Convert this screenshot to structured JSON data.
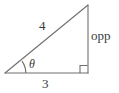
{
  "figure": {
    "type": "right-triangle-diagram",
    "stroke_color": "#6e6e6e",
    "text_color": "#3a3a3a",
    "background_color": "#ffffff",
    "geometry": {
      "vertex_left": [
        5,
        73
      ],
      "vertex_bottom_right": [
        88,
        73
      ],
      "vertex_top_right": [
        88,
        5
      ],
      "right_angle_marker": {
        "at_vertex": "bottom-right",
        "size": 8
      },
      "angle_arc": {
        "at_vertex": "left",
        "radius": 20,
        "label": "theta"
      }
    },
    "labels": {
      "hypotenuse": "4",
      "adjacent": "3",
      "opposite": "opp",
      "angle": "θ"
    }
  }
}
